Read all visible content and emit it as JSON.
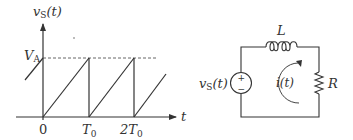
{
  "colors": {
    "line": "#333333",
    "background": "#ffffff"
  },
  "waveform": {
    "y_axis_label_v": "v",
    "y_axis_label_sub": "S",
    "y_axis_label_arg": "(t)",
    "level_label_v": "V",
    "level_label_sub": "A",
    "x_axis_label": "t",
    "ticks": [
      {
        "main": "0",
        "sub": ""
      },
      {
        "main": "T",
        "sub": "0"
      },
      {
        "main": "2T",
        "sub": "0"
      }
    ],
    "shape": "sawtooth",
    "period": "T0",
    "amplitude": "VA"
  },
  "circuit": {
    "source_label_v": "v",
    "source_label_sub": "S",
    "source_label_arg": "(t)",
    "source_plus": "+",
    "source_minus": "−",
    "inductor_label": "L",
    "resistor_label": "R",
    "current_label": "i(t)",
    "current_direction": "clockwise"
  }
}
